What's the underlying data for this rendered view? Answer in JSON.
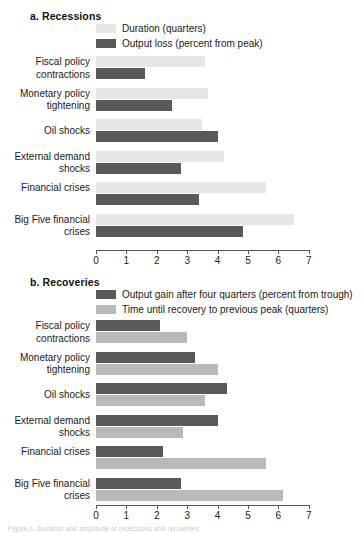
{
  "figure": {
    "caption_fragment": "Figure 1. Duration and amplitude of recessions and recoveries"
  },
  "axis": {
    "ticks": [
      "0",
      "1",
      "2",
      "3",
      "4",
      "5",
      "6",
      "7"
    ],
    "min": 0,
    "max": 7
  },
  "colors": {
    "light_duration": "#e6e6e6",
    "light_recovery": "#b9b9b9",
    "dark": "#595959",
    "axis": "#555555",
    "text": "#1a1a1a"
  },
  "panel_a": {
    "title": "a. Recessions",
    "legend": [
      {
        "label": "Duration (quarters)",
        "color": "#e6e6e6"
      },
      {
        "label": "Output loss (percent from peak)",
        "color": "#595959"
      }
    ]
  },
  "panel_b": {
    "title": "b. Recoveries",
    "legend": [
      {
        "label": "Output gain after four quarters (percent from trough)",
        "color": "#595959"
      },
      {
        "label": "Time until recovery to previous peak (quarters)",
        "color": "#b9b9b9"
      }
    ]
  },
  "chart_data": [
    {
      "type": "bar",
      "title": "a. Recessions",
      "orientation": "horizontal",
      "xlabel": "",
      "ylabel": "",
      "xlim": [
        0,
        7
      ],
      "grid": false,
      "legend_position": "top",
      "categories": [
        "Fiscal policy contractions",
        "Monetary policy tightening",
        "Oil shocks",
        "External demand shocks",
        "Financial crises",
        "Big Five financial crises"
      ],
      "series": [
        {
          "name": "Duration (quarters)",
          "color": "#e6e6e6",
          "values": [
            3.6,
            3.7,
            3.5,
            4.2,
            5.6,
            6.5
          ]
        },
        {
          "name": "Output loss (percent from peak)",
          "color": "#595959",
          "values": [
            1.6,
            2.5,
            4.0,
            2.8,
            3.4,
            4.85
          ]
        }
      ]
    },
    {
      "type": "bar",
      "title": "b. Recoveries",
      "orientation": "horizontal",
      "xlabel": "",
      "ylabel": "",
      "xlim": [
        0,
        7
      ],
      "grid": false,
      "legend_position": "top",
      "categories": [
        "Fiscal policy contractions",
        "Monetary policy tightening",
        "Oil shocks",
        "External demand shocks",
        "Financial crises",
        "Big Five financial crises"
      ],
      "series": [
        {
          "name": "Output gain after four quarters (percent from trough)",
          "color": "#595959",
          "values": [
            2.1,
            3.25,
            4.3,
            4.0,
            2.2,
            2.8
          ]
        },
        {
          "name": "Time until recovery to previous peak (quarters)",
          "color": "#b9b9b9",
          "values": [
            3.0,
            4.0,
            3.6,
            2.85,
            5.6,
            6.15
          ]
        }
      ]
    }
  ]
}
